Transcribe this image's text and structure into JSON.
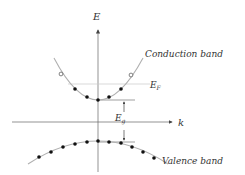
{
  "diagram": {
    "axes": {
      "y_label": "E",
      "x_label": "k"
    },
    "labels": {
      "conduction_band": "Conduction band",
      "valence_band": "Valence band",
      "fermi_level": "E",
      "fermi_level_sub": "F",
      "band_gap": "E",
      "band_gap_sub": "g"
    },
    "colors": {
      "curve": "#b0b0b0",
      "axis": "#555555",
      "dot_filled": "#111111",
      "dot_open": "#ffffff",
      "text": "#333333"
    },
    "conduction_band": {
      "filled_states": 5,
      "empty_states": 2
    },
    "valence_band": {
      "filled_states": 11
    }
  }
}
